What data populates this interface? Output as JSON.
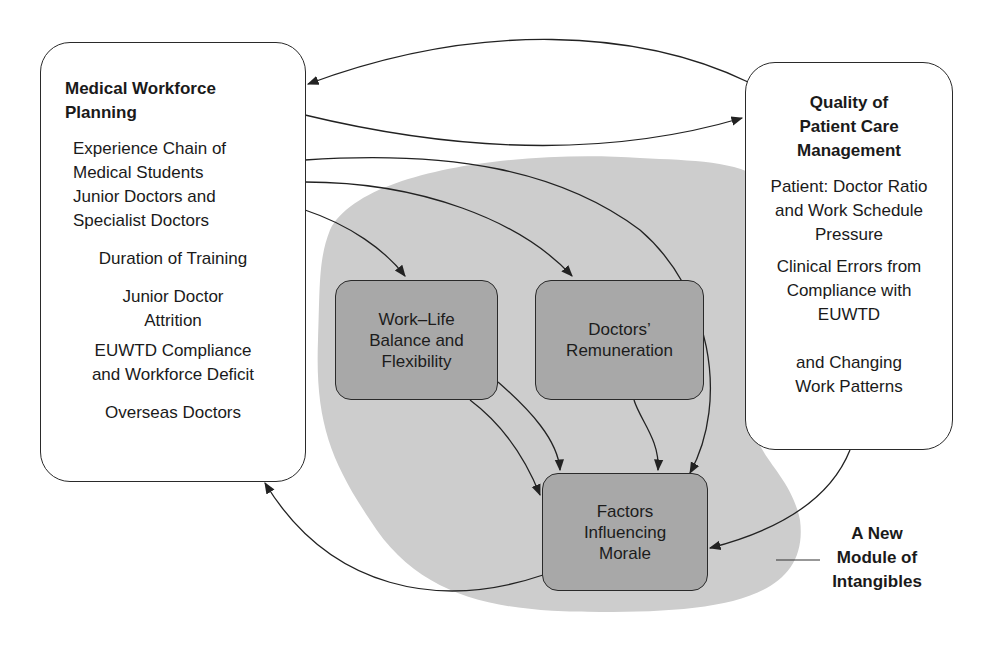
{
  "diagram": {
    "left_box": {
      "title": "Medical Workforce\nPlanning",
      "items": [
        "Experience Chain of\nMedical Students\nJunior Doctors and\nSpecialist Doctors",
        "Duration of Training",
        "Junior Doctor\nAttrition",
        "EUWTD Compliance\nand Workforce Deficit",
        "Overseas Doctors"
      ]
    },
    "right_box": {
      "title": "Quality of\nPatient Care\nManagement",
      "items": [
        "Patient: Doctor Ratio\nand Work Schedule\nPressure",
        "Clinical Errors from\nCompliance with\nEUWTD",
        "and Changing\nWork Patterns"
      ]
    },
    "inner_nodes": {
      "work_life": "Work–Life\nBalance and\nFlexibility",
      "remuneration": "Doctors’\nRemuneration",
      "morale": "Factors\nInfluencing\nMorale"
    },
    "module_label": "A New\nModule of\nIntangibles",
    "colors": {
      "module_fill": "#cdcdcd",
      "inner_node_fill": "#a8a8a8",
      "outline": "#2a2a2a",
      "background": "#ffffff"
    },
    "edges": [
      {
        "from": "Quality of Patient Care Management",
        "to": "Medical Workforce Planning"
      },
      {
        "from": "Medical Workforce Planning",
        "to": "Quality of Patient Care Management"
      },
      {
        "from": "Medical Workforce Planning",
        "to": "Work–Life Balance and Flexibility"
      },
      {
        "from": "Medical Workforce Planning",
        "to": "Doctors’ Remuneration"
      },
      {
        "from": "Medical Workforce Planning",
        "to": "Factors Influencing Morale"
      },
      {
        "from": "Work–Life Balance and Flexibility",
        "to": "Factors Influencing Morale"
      },
      {
        "from": "Doctors’ Remuneration",
        "to": "Factors Influencing Morale"
      },
      {
        "from": "Quality of Patient Care Management",
        "to": "Factors Influencing Morale"
      },
      {
        "from": "Factors Influencing Morale",
        "to": "Medical Workforce Planning"
      }
    ]
  }
}
